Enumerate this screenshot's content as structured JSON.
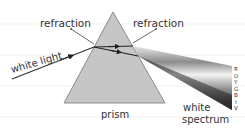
{
  "diagram": {
    "labels": {
      "refraction_left": "refraction",
      "refraction_right": "refraction",
      "white_light": "white light",
      "prism": "prism",
      "white_spectrum_line1": "white",
      "white_spectrum_line2": "spectrum"
    },
    "spectrum_letters": [
      "R",
      "O",
      "Y",
      "G",
      "B",
      "I",
      "V"
    ],
    "colors": {
      "prism_fill": "#c6c6c6",
      "prism_stroke": "#8a8a8a",
      "ray": "#333333",
      "text": "#333333",
      "ruled_line": "#eeeeee"
    }
  }
}
